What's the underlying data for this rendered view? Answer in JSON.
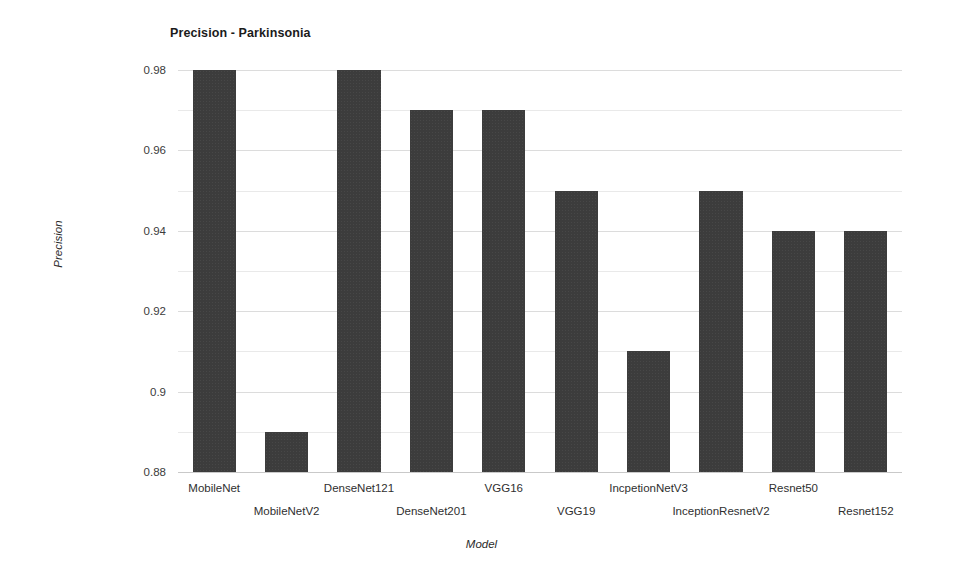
{
  "chart_data": {
    "type": "bar",
    "title": "Precision - Parkinsonia",
    "xlabel": "Model",
    "ylabel": "Precision",
    "categories": [
      "MobileNet",
      "MobileNetV2",
      "DenseNet121",
      "DenseNet201",
      "VGG16",
      "VGG19",
      "IncpetionNetV3",
      "InceptionResnetV2",
      "Resnet50",
      "Resnet152"
    ],
    "values": [
      0.98,
      0.89,
      0.98,
      0.97,
      0.97,
      0.95,
      0.91,
      0.95,
      0.94,
      0.94
    ],
    "ylim": [
      0.88,
      0.98
    ],
    "ytick_labels": [
      "0.98",
      "0.96",
      "0.94",
      "0.92",
      "0.9",
      "0.88"
    ],
    "ytick_values": [
      0.98,
      0.96,
      0.94,
      0.92,
      0.9,
      0.88
    ],
    "minor_gridline_values": [
      0.97,
      0.95,
      0.93,
      0.91,
      0.89
    ],
    "grid": true,
    "legend": "none",
    "bar_color": "#3c3c3c",
    "gridline_color": "#e4e4e4",
    "background_color": "#ffffff"
  }
}
